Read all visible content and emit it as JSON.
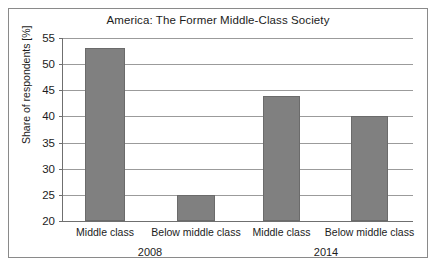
{
  "chart_data": {
    "type": "bar",
    "title": "America: The Former Middle-Class Society",
    "xlabel": "",
    "ylabel": "Share of respondents [%]",
    "ylim": [
      20,
      55
    ],
    "ytick_labels": [
      "55",
      "50",
      "45",
      "40",
      "35",
      "30",
      "25",
      "20"
    ],
    "ytick_values": [
      55,
      50,
      45,
      40,
      35,
      30,
      25,
      20
    ],
    "grid": true,
    "legend": "none",
    "bar_color": "#808080",
    "categories": [
      "Middle class",
      "Below middle class",
      "Middle class",
      "Below middle class"
    ],
    "values": [
      53,
      25,
      44,
      40
    ],
    "groups": [
      {
        "label": "2008",
        "categories": [
          "Middle class",
          "Below middle class"
        ],
        "values": [
          53,
          25
        ]
      },
      {
        "label": "2014",
        "categories": [
          "Middle class",
          "Below middle class"
        ],
        "values": [
          44,
          40
        ]
      }
    ],
    "group_labels": [
      "2008",
      "2014"
    ]
  }
}
